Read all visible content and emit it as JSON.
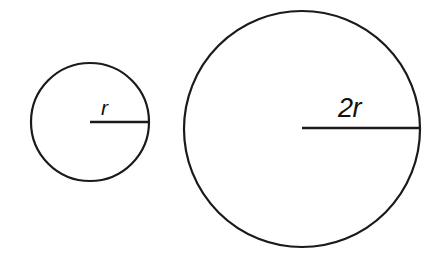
{
  "figure": {
    "kind": "geometry-diagram",
    "background_color": "#ffffff",
    "stroke_color": "#1a1a1a",
    "text_color": "#111111",
    "canvas": {
      "width": 442,
      "height": 264
    }
  },
  "shapes": {
    "small_circle": {
      "name": "small-circle",
      "center_x": 90,
      "center_y": 122,
      "radius": 59,
      "radius_label": "r",
      "radius_line": {
        "x1": 90,
        "y1": 122,
        "x2": 149,
        "y2": 122
      }
    },
    "large_circle": {
      "name": "large-circle",
      "center_x": 302,
      "center_y": 129,
      "radius": 118,
      "radius_label": "2r",
      "radius_line": {
        "x1": 302,
        "y1": 128,
        "x2": 420,
        "y2": 128
      }
    }
  },
  "labels": {
    "small_radius": "r",
    "large_radius": "2r"
  },
  "chart_data": {
    "type": "diagram",
    "items": [
      {
        "shape": "circle",
        "label": "r",
        "radius_value": 1,
        "pixel_radius": 59,
        "center": [
          90,
          122
        ]
      },
      {
        "shape": "circle",
        "label": "2r",
        "radius_value": 2,
        "pixel_radius": 118,
        "center": [
          302,
          129
        ]
      }
    ],
    "relationship": "The second circle has twice the radius of the first."
  }
}
